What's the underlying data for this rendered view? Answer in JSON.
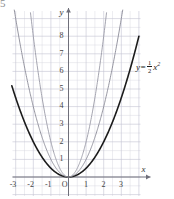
{
  "figure": {
    "number": "5",
    "caption_equation_plain": "y = 1/2 x^2"
  },
  "equation_label": {
    "lhs": "y",
    "equals": "=",
    "numerator": "1",
    "denominator": "2",
    "variable": "x",
    "exponent": "2"
  },
  "axes": {
    "x_name": "x",
    "y_name": "y",
    "origin_label": "O",
    "x_ticks": [
      "-3",
      "-2",
      "-1",
      "1",
      "2",
      "3"
    ],
    "y_ticks": [
      "1",
      "2",
      "3",
      "4",
      "5",
      "6",
      "7",
      "8"
    ],
    "x_range": [
      -3.6,
      3.6
    ],
    "y_range": [
      -0.6,
      9.2
    ],
    "grid": true,
    "grid_step": 0.5
  },
  "colors": {
    "grid_minor": "#d7d7e0",
    "grid_major": "#c3c3d2",
    "axis": "#6f6f7a",
    "curve_main": "#1b1b1b",
    "curve_mid": "#8a8a96",
    "curve_steep": "#9a9aa6",
    "text": "#3a3a3a",
    "figure_number": "#8d8d8d"
  },
  "chart_data": {
    "type": "line",
    "title": "",
    "xlabel": "x",
    "ylabel": "y",
    "xlim": [
      -3.6,
      3.6
    ],
    "ylim": [
      -0.6,
      9.2
    ],
    "grid": true,
    "legend": "inline-annotation",
    "annotations": [
      {
        "text": "y = 1/2 x^2",
        "x": 3.35,
        "y": 6.4,
        "target_series": "y = 1/2 x^2"
      }
    ],
    "series": [
      {
        "name": "y = 1/2 x^2",
        "coefficient": 0.5,
        "color": "#1b1b1b",
        "width": 1.6,
        "x": [
          -3.5,
          -3,
          -2.5,
          -2,
          -1.5,
          -1,
          -0.5,
          0,
          0.5,
          1,
          1.5,
          2,
          2.5,
          3,
          3.5
        ],
        "values": [
          6.125,
          4.5,
          3.125,
          2,
          1.125,
          0.5,
          0.125,
          0,
          0.125,
          0.5,
          1.125,
          2,
          3.125,
          4.5,
          6.125
        ]
      },
      {
        "name": "y = x^2",
        "coefficient": 1,
        "color": "#8a8a96",
        "width": 0.9,
        "x": [
          -3,
          -2.5,
          -2,
          -1.5,
          -1,
          -0.5,
          0,
          0.5,
          1,
          1.5,
          2,
          2.5,
          3
        ],
        "values": [
          9,
          6.25,
          4,
          2.25,
          1,
          0.25,
          0,
          0.25,
          1,
          2.25,
          4,
          6.25,
          9
        ]
      },
      {
        "name": "y = 2x^2",
        "coefficient": 2,
        "color": "#9a9aa6",
        "width": 0.9,
        "x": [
          -2.15,
          -2,
          -1.5,
          -1,
          -0.5,
          0,
          0.5,
          1,
          1.5,
          2,
          2.15
        ],
        "values": [
          9.2,
          8,
          4.5,
          2,
          0.5,
          0,
          0.5,
          2,
          4.5,
          8,
          9.2
        ]
      }
    ]
  }
}
